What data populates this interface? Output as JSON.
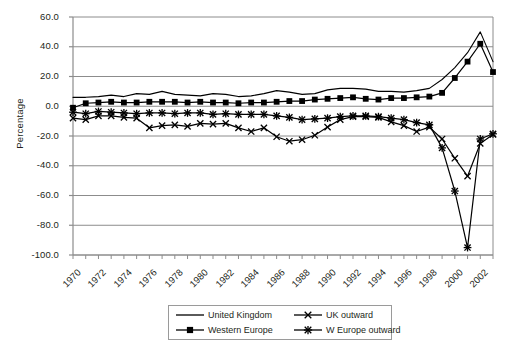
{
  "chart_data": {
    "type": "line",
    "title": "",
    "xlabel": "",
    "ylabel": "Percentage",
    "xlim": [
      1970,
      2003
    ],
    "ylim": [
      -100,
      60
    ],
    "ytick_labels": [
      "60.0",
      "40.0",
      "20.0",
      "0.0",
      "-20.0",
      "-40.0",
      "-60.0",
      "-80.0",
      "-100.0"
    ],
    "ytick_values": [
      60,
      40,
      20,
      0,
      -20,
      -40,
      -60,
      -80,
      -100
    ],
    "xtick_labels": [
      "1970",
      "1972",
      "1974",
      "1976",
      "1978",
      "1980",
      "1982",
      "1984",
      "1986",
      "1988",
      "1990",
      "1992",
      "1994",
      "1996",
      "1998",
      "2000",
      "2002"
    ],
    "xtick_values": [
      1970,
      1972,
      1974,
      1976,
      1978,
      1980,
      1982,
      1984,
      1986,
      1988,
      1990,
      1992,
      1994,
      1996,
      1998,
      2000,
      2002
    ],
    "minor_tick_step": 1,
    "grid": "horizontal",
    "legend_position": "bottom-center",
    "x": [
      1970,
      1971,
      1972,
      1973,
      1974,
      1975,
      1976,
      1977,
      1978,
      1979,
      1980,
      1981,
      1982,
      1983,
      1984,
      1985,
      1986,
      1987,
      1988,
      1989,
      1990,
      1991,
      1992,
      1993,
      1994,
      1995,
      1996,
      1997,
      1998,
      1999,
      2000,
      2001,
      2002,
      2003
    ],
    "series": [
      {
        "name": "United Kingdom",
        "marker": "none",
        "values": [
          6.0,
          6.0,
          6.5,
          7.5,
          6.5,
          8.5,
          8.0,
          10.0,
          8.0,
          7.5,
          7.0,
          8.5,
          8.0,
          6.5,
          7.0,
          8.5,
          10.5,
          9.5,
          8.0,
          8.5,
          11.0,
          12.0,
          12.0,
          11.5,
          10.0,
          10.0,
          9.5,
          10.5,
          12.0,
          18.0,
          26.0,
          36.0,
          50.0,
          30.0
        ]
      },
      {
        "name": "Western Europe",
        "marker": "square",
        "values": [
          -1.0,
          2.0,
          2.5,
          3.0,
          2.5,
          2.5,
          3.0,
          3.0,
          3.0,
          2.5,
          3.0,
          2.5,
          2.5,
          2.0,
          2.5,
          2.5,
          3.0,
          3.5,
          3.5,
          4.5,
          5.0,
          5.5,
          6.0,
          5.0,
          4.5,
          5.5,
          5.5,
          6.0,
          6.5,
          9.0,
          19.0,
          30.0,
          42.0,
          23.0
        ]
      },
      {
        "name": "UK outward",
        "marker": "x",
        "values": [
          -8.0,
          -9.0,
          -6.5,
          -6.5,
          -7.5,
          -8.0,
          -14.5,
          -13.0,
          -12.5,
          -13.5,
          -11.5,
          -12.0,
          -11.5,
          -14.5,
          -17.0,
          -14.5,
          -20.5,
          -23.5,
          -22.5,
          -19.5,
          -14.0,
          -9.0,
          -7.0,
          -7.0,
          -7.5,
          -10.5,
          -13.0,
          -17.0,
          -14.0,
          -22.0,
          -35.0,
          -47.0,
          -25.0,
          -19.0
        ]
      },
      {
        "name": "W Europe outward",
        "marker": "asterisk",
        "values": [
          -4.0,
          -5.0,
          -3.5,
          -4.0,
          -4.5,
          -5.0,
          -4.5,
          -4.5,
          -5.0,
          -4.5,
          -4.5,
          -5.5,
          -5.0,
          -5.5,
          -5.5,
          -5.5,
          -6.5,
          -7.5,
          -9.0,
          -8.5,
          -8.0,
          -7.0,
          -6.5,
          -6.5,
          -7.0,
          -8.0,
          -9.0,
          -11.0,
          -12.5,
          -28.0,
          -57.0,
          -95.0,
          -22.0,
          -18.5
        ]
      }
    ]
  },
  "legend": {
    "items": [
      {
        "label": "United Kingdom",
        "marker": "none"
      },
      {
        "label": "UK outward",
        "marker": "x"
      },
      {
        "label": "Western Europe",
        "marker": "square"
      },
      {
        "label": "W Europe outward",
        "marker": "asterisk"
      }
    ]
  },
  "colors": {
    "line": "#000000",
    "grid": "#8c8c8c",
    "axis": "#8c8c8c",
    "text": "#231f20",
    "background": "#ffffff"
  }
}
